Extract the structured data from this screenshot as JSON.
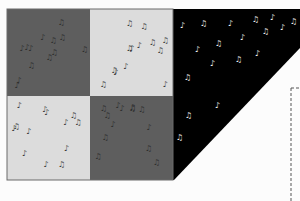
{
  "diagram": {
    "colors": {
      "background": "#fcfcfc",
      "dark_gray": "#5e5e5e",
      "light_gray": "#dcdcdc",
      "black": "#000000",
      "border": "#6a6a6a",
      "note_on_dark": "#2e2e2e",
      "note_on_light": "#3a3a3a",
      "note_on_black": "#f4f4f4",
      "dashed_line": "#555555"
    },
    "patches": [
      {
        "id": "top-left",
        "fill": "dark_gray",
        "x": 7,
        "y": 9,
        "w": 83,
        "h": 87
      },
      {
        "id": "top-right",
        "fill": "light_gray",
        "x": 90,
        "y": 9,
        "w": 83,
        "h": 87
      },
      {
        "id": "bottom-left",
        "fill": "light_gray",
        "x": 7,
        "y": 96,
        "w": 83,
        "h": 84
      },
      {
        "id": "bottom-right",
        "fill": "dark_gray",
        "x": 90,
        "y": 96,
        "w": 83,
        "h": 84
      }
    ],
    "triangle": {
      "fill": "black",
      "points": "173,9 300,9 300,48 174,180 173,180"
    },
    "dashed_guide": {
      "x": 291,
      "y1": 88,
      "y2": 201,
      "tick_x2": 300
    },
    "glyph": "♪",
    "glyph_alt": "♫"
  }
}
